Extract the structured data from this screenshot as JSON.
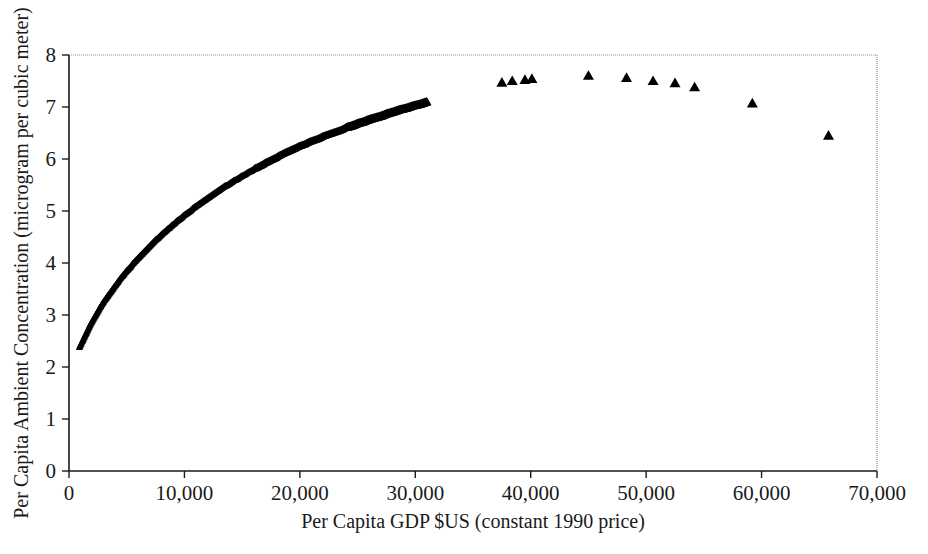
{
  "chart_data": {
    "type": "scatter",
    "title": "",
    "xlabel": "Per Capita GDP $US (constant 1990 price)",
    "ylabel": "Per Capita Ambient Concentration (microgram per cubic meter)",
    "xlim": [
      0,
      70000
    ],
    "ylim": [
      0,
      8
    ],
    "xticks": [
      0,
      10000,
      20000,
      30000,
      40000,
      50000,
      60000,
      70000
    ],
    "xticklabels": [
      "0",
      "10,000",
      "20,000",
      "30,000",
      "40,000",
      "50,000",
      "60,000",
      "70,000"
    ],
    "yticks": [
      0,
      1,
      2,
      3,
      4,
      5,
      6,
      7,
      8
    ],
    "yticklabels": [
      "0",
      "1",
      "2",
      "3",
      "4",
      "5",
      "6",
      "7",
      "8"
    ],
    "grid": false,
    "legend": null,
    "marker": "triangle-up",
    "marker_color": "#000000",
    "frame": {
      "left": "solid",
      "bottom": "solid",
      "top": "dotted-thin",
      "right": "dotted-thin"
    },
    "series": [
      {
        "name": "Per capita ambient concentration vs per capita GDP",
        "points": [
          [
            900,
            2.38
          ],
          [
            1100,
            2.44
          ],
          [
            1300,
            2.5
          ],
          [
            1500,
            2.56
          ],
          [
            1700,
            2.62
          ],
          [
            1900,
            2.68
          ],
          [
            2100,
            2.73
          ],
          [
            2300,
            2.78
          ],
          [
            2500,
            2.83
          ],
          [
            2700,
            2.88
          ],
          [
            2900,
            2.93
          ],
          [
            3100,
            2.97
          ],
          [
            3300,
            3.01
          ],
          [
            3500,
            3.05
          ],
          [
            3700,
            3.09
          ],
          [
            3900,
            3.13
          ],
          [
            4100,
            3.17
          ],
          [
            4300,
            3.21
          ],
          [
            4500,
            3.25
          ],
          [
            4700,
            3.28
          ],
          [
            4900,
            3.32
          ],
          [
            5100,
            3.35
          ],
          [
            5300,
            3.38
          ],
          [
            5500,
            3.42
          ],
          [
            5700,
            3.45
          ],
          [
            5900,
            3.48
          ],
          [
            6100,
            3.51
          ],
          [
            6300,
            3.54
          ],
          [
            6500,
            3.57
          ],
          [
            6700,
            3.6
          ],
          [
            6900,
            3.63
          ],
          [
            7100,
            3.66
          ],
          [
            7300,
            3.69
          ],
          [
            7500,
            3.72
          ],
          [
            7700,
            3.74
          ],
          [
            7900,
            3.77
          ],
          [
            8100,
            3.8
          ],
          [
            8300,
            3.82
          ],
          [
            8500,
            3.85
          ],
          [
            8700,
            3.87
          ],
          [
            8900,
            3.9
          ],
          [
            9100,
            3.92
          ],
          [
            9300,
            3.95
          ],
          [
            9500,
            3.97
          ],
          [
            9700,
            3.99
          ],
          [
            9900,
            4.02
          ],
          [
            10100,
            4.04
          ],
          [
            10300,
            4.06
          ],
          [
            10500,
            4.08
          ],
          [
            10700,
            4.11
          ],
          [
            10900,
            4.13
          ],
          [
            11100,
            4.15
          ],
          [
            11300,
            4.17
          ],
          [
            11500,
            4.19
          ],
          [
            11700,
            4.21
          ],
          [
            11900,
            4.23
          ],
          [
            12100,
            4.25
          ],
          [
            12300,
            4.27
          ],
          [
            12500,
            4.29
          ],
          [
            12700,
            4.31
          ],
          [
            12900,
            4.33
          ],
          [
            13100,
            4.35
          ],
          [
            13300,
            4.37
          ],
          [
            13500,
            4.39
          ],
          [
            13700,
            4.4
          ],
          [
            13900,
            4.42
          ],
          [
            14100,
            4.44
          ],
          [
            14300,
            4.46
          ],
          [
            14500,
            4.47
          ],
          [
            14700,
            4.49
          ],
          [
            14900,
            4.51
          ],
          [
            15200,
            4.53
          ],
          [
            15500,
            4.56
          ],
          [
            15800,
            4.58
          ],
          [
            16100,
            4.61
          ],
          [
            16400,
            4.63
          ],
          [
            16700,
            4.65
          ],
          [
            17000,
            4.68
          ],
          [
            17300,
            4.7
          ],
          [
            17600,
            4.72
          ],
          [
            17900,
            4.74
          ],
          [
            18200,
            4.77
          ],
          [
            18500,
            4.79
          ],
          [
            18800,
            4.81
          ],
          [
            19100,
            4.83
          ],
          [
            19400,
            4.85
          ],
          [
            19700,
            4.87
          ],
          [
            20000,
            4.89
          ],
          [
            20400,
            4.91
          ],
          [
            20800,
            4.94
          ],
          [
            21200,
            4.96
          ],
          [
            21600,
            4.98
          ],
          [
            22000,
            5.01
          ],
          [
            22400,
            5.03
          ],
          [
            22800,
            5.05
          ],
          [
            23200,
            5.07
          ],
          [
            23600,
            5.09
          ],
          [
            24000,
            5.12
          ],
          [
            24500,
            5.14
          ],
          [
            25000,
            5.17
          ],
          [
            25500,
            5.19
          ],
          [
            26000,
            5.22
          ],
          [
            26500,
            5.24
          ],
          [
            27000,
            5.26
          ],
          [
            27500,
            5.29
          ],
          [
            28000,
            5.31
          ],
          [
            28600,
            5.34
          ],
          [
            29200,
            5.36
          ],
          [
            29800,
            5.39
          ],
          [
            30400,
            5.41
          ],
          [
            31000,
            5.44
          ]
        ],
        "note": "dense-band-approximation"
      }
    ],
    "outlier_points": [
      [
        37500,
        7.47
      ],
      [
        38400,
        7.5
      ],
      [
        39500,
        7.52
      ],
      [
        40100,
        7.54
      ],
      [
        45000,
        7.6
      ],
      [
        48300,
        7.56
      ],
      [
        50600,
        7.5
      ],
      [
        52500,
        7.46
      ],
      [
        54200,
        7.38
      ],
      [
        59200,
        7.07
      ],
      [
        65800,
        6.45
      ]
    ]
  }
}
